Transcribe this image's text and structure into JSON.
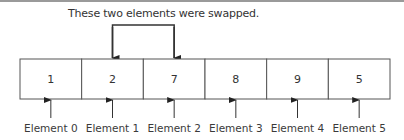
{
  "caption": "These two elements were swapped.",
  "array": {
    "values": [
      "1",
      "2",
      "7",
      "8",
      "9",
      "5"
    ],
    "labels": [
      "Element 0",
      "Element 1",
      "Element 2",
      "Element 3",
      "Element 4",
      "Element 5"
    ]
  },
  "swapped_indices": [
    1,
    2
  ],
  "colors": {
    "stroke": "#3a3a3a",
    "border": "#555555",
    "top_rule": "#9a9a9a"
  }
}
